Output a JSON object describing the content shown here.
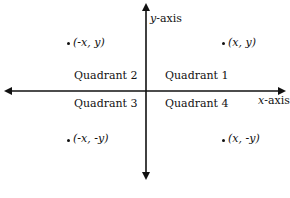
{
  "axes": {
    "x_label_var": "x",
    "x_label_suffix": "-axis",
    "y_label_var": "y",
    "y_label_suffix": "-axis"
  },
  "quadrants": [
    {
      "label": "Quadrant 1",
      "point": "(x, y)"
    },
    {
      "label": "Quadrant 2",
      "point": "(-x, y)"
    },
    {
      "label": "Quadrant 3",
      "point": "(-x, -y)"
    },
    {
      "label": "Quadrant 4",
      "point": "(x, -y)"
    }
  ],
  "colors": {
    "ink": "#111111",
    "background": "#ffffff"
  }
}
